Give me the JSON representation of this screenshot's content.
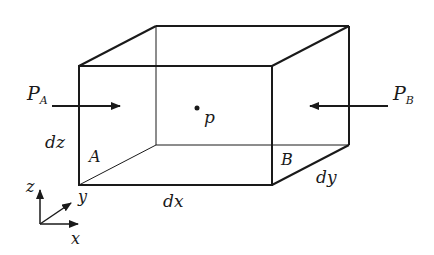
{
  "diagram": {
    "labels": {
      "pa_main": "P",
      "pa_sub": "A",
      "pb_main": "P",
      "pb_sub": "B",
      "point": "p",
      "face_a": "A",
      "face_b": "B",
      "dx": "dx",
      "dy": "dy",
      "dz": "dz"
    },
    "axes": {
      "z": "z",
      "y": "y",
      "x": "x"
    },
    "colors": {
      "stroke": "#1a1a1a",
      "background": "#ffffff"
    }
  }
}
